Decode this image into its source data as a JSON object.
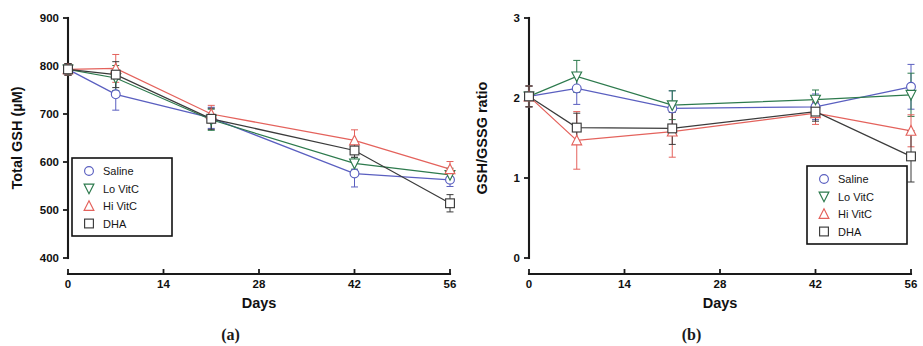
{
  "figure": {
    "panels": [
      {
        "caption": "(a)",
        "chart_data": {
          "type": "line",
          "title": "",
          "xlabel": "Days",
          "ylabel": "Total GSH (µM)",
          "x": [
            0,
            7,
            21,
            42,
            56
          ],
          "xticks": [
            0,
            14,
            28,
            42,
            56
          ],
          "xticklabels": [
            "0",
            "14",
            "28",
            "42",
            "56"
          ],
          "yticks": [
            400,
            500,
            600,
            700,
            800,
            900
          ],
          "yticklabels": [
            "400",
            "500",
            "600",
            "700",
            "800",
            "900"
          ],
          "xlim": [
            0,
            56
          ],
          "ylim": [
            400,
            900
          ],
          "grid": false,
          "legend_position": "lower-left",
          "series": [
            {
              "name": "Saline",
              "color": "#5a5fc0",
              "marker": "circle",
              "values": [
                793,
                741,
                692,
                576,
                563
              ],
              "errors": [
                12,
                33,
                22,
                28,
                14
              ]
            },
            {
              "name": "Lo VitC",
              "color": "#2d7a4d",
              "marker": "triangle-down",
              "values": [
                793,
                775,
                688,
                597,
                573
              ],
              "errors": [
                12,
                26,
                22,
                12,
                14
              ]
            },
            {
              "name": "Hi VitC",
              "color": "#e4625c",
              "marker": "triangle-up",
              "values": [
                793,
                795,
                700,
                645,
                585
              ],
              "errors": [
                12,
                29,
                18,
                22,
                16
              ]
            },
            {
              "name": "DHA",
              "color": "#3b3b3b",
              "marker": "square",
              "values": [
                793,
                782,
                690,
                624,
                514
              ],
              "errors": [
                12,
                27,
                22,
                14,
                18
              ]
            }
          ]
        }
      },
      {
        "caption": "(b)",
        "chart_data": {
          "type": "line",
          "title": "",
          "xlabel": "Days",
          "ylabel": "GSH/GSSG ratio",
          "x": [
            0,
            7,
            21,
            42,
            56
          ],
          "xticks": [
            0,
            14,
            28,
            42,
            56
          ],
          "xticklabels": [
            "0",
            "14",
            "28",
            "42",
            "56"
          ],
          "yticks": [
            0,
            1,
            2,
            3
          ],
          "yticklabels": [
            "0",
            "1",
            "2",
            "3"
          ],
          "xlim": [
            0,
            56
          ],
          "ylim": [
            0,
            3
          ],
          "grid": false,
          "legend_position": "lower-right",
          "series": [
            {
              "name": "Saline",
              "color": "#5a5fc0",
              "marker": "circle",
              "values": [
                2.02,
                2.12,
                1.87,
                1.89,
                2.14
              ],
              "errors": [
                0.13,
                0.2,
                0.22,
                0.16,
                0.28
              ]
            },
            {
              "name": "Lo VitC",
              "color": "#2d7a4d",
              "marker": "triangle-down",
              "values": [
                2.02,
                2.27,
                1.91,
                1.98,
                2.04
              ],
              "errors": [
                0.13,
                0.2,
                0.18,
                0.12,
                0.27
              ]
            },
            {
              "name": "Hi VitC",
              "color": "#e4625c",
              "marker": "triangle-up",
              "values": [
                2.02,
                1.47,
                1.58,
                1.81,
                1.59
              ],
              "errors": [
                0.13,
                0.36,
                0.32,
                0.14,
                0.2
              ]
            },
            {
              "name": "DHA",
              "color": "#3b3b3b",
              "marker": "square",
              "values": [
                2.02,
                1.63,
                1.62,
                1.83,
                1.27
              ],
              "errors": [
                0.13,
                0.18,
                0.2,
                0.12,
                0.32
              ]
            }
          ]
        }
      }
    ]
  }
}
